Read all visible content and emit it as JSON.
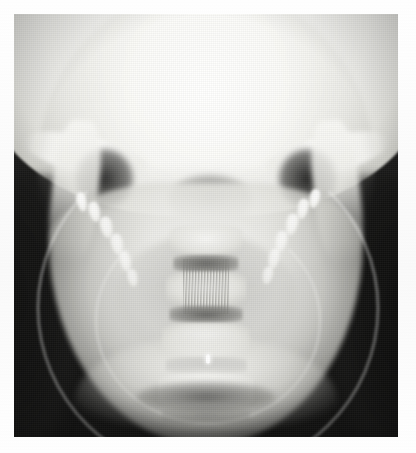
{
  "document": {
    "page_background": "#ffffff",
    "caption": ""
  },
  "image": {
    "name": "radiograph",
    "modality": "X-ray (plain radiograph)",
    "view": "posteroanterior (PA) skull / mandible",
    "region": "skull base, mandible and cervical spine",
    "frame": {
      "x": 14,
      "y": 14,
      "width": 384,
      "height": 423
    },
    "tone": {
      "film_background": "#141413",
      "bone_bright": "#fbfbf9",
      "soft_tissue_mid": "#9a9a96",
      "air_dark": "#1b1b1a",
      "marker_color": "#ffffff"
    },
    "features": [
      {
        "name": "cranial-vault",
        "description": "broad overexposed bright dome occupying the upper third"
      },
      {
        "name": "zygomatic-arch-left",
        "description": "bright diagonal band at mid-left"
      },
      {
        "name": "zygomatic-arch-right",
        "description": "bright diagonal band at mid-right"
      },
      {
        "name": "air-shadow-left",
        "description": "dark rounded void lateral to left maxilla"
      },
      {
        "name": "air-shadow-right",
        "description": "dark rounded void lateral to right maxilla"
      },
      {
        "name": "dental-arch-left",
        "description": "cluster of radiopaque teeth, left side"
      },
      {
        "name": "dental-arch-right",
        "description": "cluster of radiopaque teeth, right side"
      },
      {
        "name": "mandible-body",
        "description": "bright U-shaped arch across the lower half"
      },
      {
        "name": "mandibular-ramus-left",
        "description": "vertical bright bar, upper left"
      },
      {
        "name": "mandibular-ramus-right",
        "description": "vertical bright bar, upper right"
      },
      {
        "name": "cervical-vertebrae",
        "description": "stacked midline vertebral bodies with dark disc spaces"
      },
      {
        "name": "incisor-roots",
        "description": "fine vertical striations at the midline"
      },
      {
        "name": "radiopaque-marker",
        "description": "small bright metallic marker near the midline, lower third"
      },
      {
        "name": "symphysis-chin",
        "description": "bright curved band at the inferior border"
      }
    ],
    "teeth_left": [
      {
        "x": 8,
        "y": 2,
        "w": 12,
        "h": 16
      },
      {
        "x": 20,
        "y": 12,
        "w": 13,
        "h": 17
      },
      {
        "x": 30,
        "y": 26,
        "w": 14,
        "h": 18
      },
      {
        "x": 38,
        "y": 42,
        "w": 14,
        "h": 18
      },
      {
        "x": 44,
        "y": 58,
        "w": 13,
        "h": 17
      },
      {
        "x": 48,
        "y": 74,
        "w": 12,
        "h": 15
      }
    ],
    "teeth_right": [
      {
        "x": 62,
        "y": 2,
        "w": 12,
        "h": 16
      },
      {
        "x": 50,
        "y": 12,
        "w": 13,
        "h": 17
      },
      {
        "x": 40,
        "y": 26,
        "w": 14,
        "h": 18
      },
      {
        "x": 32,
        "y": 42,
        "w": 14,
        "h": 18
      },
      {
        "x": 28,
        "y": 58,
        "w": 13,
        "h": 17
      },
      {
        "x": 26,
        "y": 74,
        "w": 12,
        "h": 15
      }
    ],
    "vertebrae": [
      {
        "top": 50,
        "w": 19,
        "h": 7,
        "tone": "light"
      },
      {
        "top": 57,
        "w": 17,
        "h": 4,
        "tone": "dark"
      },
      {
        "top": 61,
        "w": 21,
        "h": 8,
        "tone": "light"
      },
      {
        "top": 69,
        "w": 19,
        "h": 4,
        "tone": "dark"
      },
      {
        "top": 73,
        "w": 23,
        "h": 8,
        "tone": "light"
      },
      {
        "top": 81,
        "w": 21,
        "h": 4,
        "tone": "dark"
      },
      {
        "top": 85,
        "w": 25,
        "h": 8,
        "tone": "light"
      },
      {
        "top": 93,
        "w": 23,
        "h": 4,
        "tone": "dark"
      }
    ]
  }
}
